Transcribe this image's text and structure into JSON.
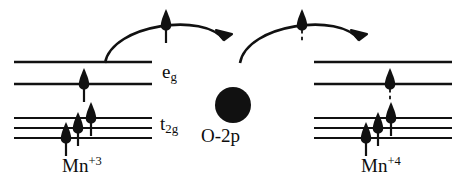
{
  "figure": {
    "background_color": "#ffffff",
    "ink_color": "#111111"
  },
  "labels": {
    "eg": {
      "base": "e",
      "sub": "g",
      "text": "eg"
    },
    "t2g": {
      "base": "t",
      "sub": "2g",
      "text": "t2g"
    },
    "oxygen": {
      "text": "O-2p"
    },
    "mn_left": {
      "base": "Mn",
      "sup": "+3",
      "text": "Mn+3"
    },
    "mn_right": {
      "base": "Mn",
      "sup": "+4",
      "text": "Mn+4"
    }
  },
  "sites": {
    "left": {
      "name": "Mn+3",
      "eg_levels": [
        {
          "y": 62,
          "x1": 14,
          "x2": 152,
          "electron": null
        },
        {
          "y": 84,
          "x1": 14,
          "x2": 152,
          "electron": {
            "spin": "up",
            "x": 84,
            "dashed_tail": false
          }
        }
      ],
      "t2g_levels": [
        {
          "y": 118,
          "x1": 14,
          "x2": 152,
          "electron": {
            "spin": "up",
            "x": 91,
            "dashed_tail": false
          }
        },
        {
          "y": 128,
          "x1": 14,
          "x2": 152,
          "electron": {
            "spin": "up",
            "x": 78,
            "dashed_tail": false
          }
        },
        {
          "y": 138,
          "x1": 14,
          "x2": 152,
          "electron": {
            "spin": "up",
            "x": 66,
            "dashed_tail": false
          }
        }
      ]
    },
    "right": {
      "name": "Mn+4",
      "eg_levels": [
        {
          "y": 62,
          "x1": 314,
          "x2": 452,
          "electron": null
        },
        {
          "y": 84,
          "x1": 314,
          "x2": 452,
          "electron": {
            "spin": "up",
            "x": 390,
            "dashed_tail": true
          }
        }
      ],
      "t2g_levels": [
        {
          "y": 118,
          "x1": 314,
          "x2": 452,
          "electron": {
            "spin": "up",
            "x": 391,
            "dashed_tail": false
          }
        },
        {
          "y": 128,
          "x1": 314,
          "x2": 452,
          "electron": {
            "spin": "up",
            "x": 378,
            "dashed_tail": false
          }
        },
        {
          "y": 138,
          "x1": 314,
          "x2": 452,
          "electron": {
            "spin": "up",
            "x": 366,
            "dashed_tail": false
          }
        }
      ]
    }
  },
  "oxygen_ion": {
    "cx": 233,
    "cy": 105,
    "r": 18,
    "color": "#111111"
  },
  "hopping_arrows": [
    {
      "name": "left-hop-arrow",
      "from_x": 105,
      "to_x": 225,
      "apex_y": 20,
      "electron": {
        "spin": "up",
        "x": 166,
        "dashed_tail": false
      }
    },
    {
      "name": "right-hop-arrow",
      "from_x": 240,
      "to_x": 360,
      "apex_y": 20,
      "electron": {
        "spin": "up",
        "x": 302,
        "dashed_tail": true
      }
    }
  ]
}
